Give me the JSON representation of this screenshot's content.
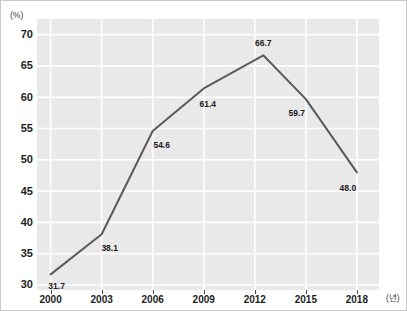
{
  "chart_data": {
    "type": "line",
    "title": "",
    "subtitle": "",
    "xlabel": "(년)",
    "ylabel": "(%)",
    "categories": [
      "2000",
      "2003",
      "2006",
      "2009",
      "2012",
      "2015",
      "2018"
    ],
    "x": [
      2000,
      2003,
      2006,
      2009,
      2012,
      2015,
      2018
    ],
    "values": [
      31.7,
      38.1,
      54.6,
      61.4,
      66.7,
      59.7,
      48.0
    ],
    "point_labels": [
      "31.7",
      "38.1",
      "54.6",
      "61.4",
      "66.7",
      "59.7",
      "48.0"
    ],
    "xlim": [
      1999.2,
      2019.3
    ],
    "ylim": [
      29.2,
      72.5
    ],
    "ytick_labels": [
      "70",
      "65",
      "60",
      "55",
      "50",
      "45",
      "40",
      "35",
      "30"
    ],
    "yticks": [
      70,
      65,
      60,
      55,
      50,
      45,
      40,
      35,
      30
    ],
    "xtick_labels": [
      "2000",
      "2003",
      "2006",
      "2009",
      "2012",
      "2015",
      "2018"
    ],
    "grid": true,
    "grid_color": "#ffffff",
    "legend": false,
    "legend_position": "none",
    "series": [
      {
        "name": "",
        "values": [
          31.7,
          38.1,
          54.6,
          61.4,
          66.7,
          59.7,
          48.0
        ],
        "color": "#5a5a5a"
      }
    ],
    "panel_color": "#e9e9e9",
    "line_color": "#5a5a5a",
    "border_color": "#c9c9c9",
    "peak": {
      "label": "66.7",
      "year_position": 2012.5
    },
    "annotations": []
  }
}
